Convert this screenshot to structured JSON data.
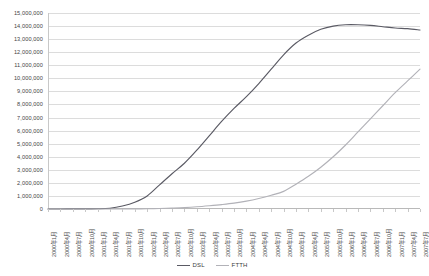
{
  "chart_data": {
    "type": "line",
    "title": "",
    "subtitle": "",
    "xlabel": "",
    "ylabel": "",
    "ylim": [
      0,
      15000000
    ],
    "ytick_step": 1000000,
    "grid": true,
    "legend_position": "bottom",
    "ytick_labels": [
      "15,000,000",
      "14,000,000",
      "13,000,000",
      "12,000,000",
      "11,000,000",
      "10,000,000",
      "9,000,000",
      "8,000,000",
      "7,000,000",
      "6,000,000",
      "5,000,000",
      "4,000,000",
      "3,000,000",
      "2,000,000",
      "1,000,000",
      "0"
    ],
    "ytick_values": [
      15000000,
      14000000,
      13000000,
      12000000,
      11000000,
      10000000,
      9000000,
      8000000,
      7000000,
      6000000,
      5000000,
      4000000,
      3000000,
      2000000,
      1000000,
      0
    ],
    "categories": [
      "2000年1月",
      "2000年4月",
      "2000年7月",
      "2000年10月",
      "2001年1月",
      "2001年4月",
      "2001年7月",
      "2001年10月",
      "2002年1月",
      "2002年4月",
      "2002年7月",
      "2002年10月",
      "2003年1月",
      "2003年4月",
      "2003年7月",
      "2003年10月",
      "2004年1月",
      "2004年4月",
      "2004年7月",
      "2004年10月",
      "2005年1月",
      "2005年4月",
      "2005年7月",
      "2005年10月",
      "2006年1月",
      "2006年4月",
      "2006年7月",
      "2006年10月",
      "2007年1月",
      "2007年4月",
      "2007年7月"
    ],
    "series": [
      {
        "name": "DSL",
        "color": "#5a5a64",
        "values": [
          0,
          2000,
          6000,
          12000,
          16000,
          60000,
          230000,
          520000,
          1000000,
          1850000,
          2700000,
          3500000,
          4500000,
          5600000,
          6700000,
          7700000,
          8600000,
          9600000,
          10700000,
          11800000,
          12700000,
          13300000,
          13750000,
          14000000,
          14100000,
          14100000,
          14050000,
          13950000,
          13850000,
          13800000,
          13700000
        ]
      },
      {
        "name": "FTTH",
        "color": "#b2b2b8",
        "values": [
          0,
          0,
          0,
          0,
          0,
          1000,
          4000,
          10000,
          20000,
          40000,
          70000,
          110000,
          170000,
          250000,
          340000,
          450000,
          600000,
          800000,
          1050000,
          1350000,
          1900000,
          2500000,
          3200000,
          4000000,
          4900000,
          5900000,
          6900000,
          7900000,
          8900000,
          9800000,
          10700000
        ]
      }
    ],
    "legend": [
      {
        "label": "DSL",
        "color": "#5a5a64",
        "swatch": "dsl"
      },
      {
        "label": "FTTH",
        "color": "#b2b2b8",
        "swatch": "ftth"
      }
    ]
  }
}
